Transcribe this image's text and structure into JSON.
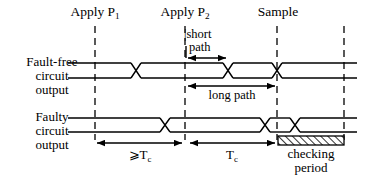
{
  "figure": {
    "width": 369,
    "height": 182,
    "background": "#ffffff",
    "line_color": "#000000"
  },
  "events": [
    {
      "id": "apply-p1",
      "label_main": "Apply",
      "label_sym": "P",
      "label_sub": "1",
      "x": 95
    },
    {
      "id": "apply-p2",
      "label_main": "Apply",
      "label_sym": "P",
      "label_sub": "2",
      "x": 185
    },
    {
      "id": "sample",
      "label_main": "Sample",
      "label_sym": "",
      "label_sub": "",
      "x": 277
    },
    {
      "id": "end",
      "label_main": "",
      "label_sym": "",
      "label_sub": "",
      "x": 344
    }
  ],
  "waveforms": [
    {
      "id": "fault-free",
      "label_lines": [
        "Fault-free",
        "circuit",
        "output"
      ],
      "y_top": 63,
      "y_bottom": 78,
      "transitions": [
        136,
        228,
        277
      ]
    },
    {
      "id": "faulty",
      "label_lines": [
        "Faulty",
        "circuit",
        "output"
      ],
      "y_top": 118,
      "y_bottom": 132,
      "transitions": [
        165,
        265,
        295
      ]
    }
  ],
  "annotations": [
    {
      "id": "short-path",
      "text_lines": [
        "|short",
        "path"
      ],
      "arrow": {
        "x1": 186,
        "x2": 228,
        "y": 58,
        "heads": "both"
      }
    },
    {
      "id": "long-path",
      "text_lines": [
        "long path"
      ],
      "arrow": {
        "x1": 186,
        "x2": 277,
        "y": 86,
        "heads": "both"
      }
    }
  ],
  "measurements": [
    {
      "id": "ge-tc",
      "label_prefix": "⩾",
      "label_sym": "T",
      "label_sub": "c",
      "arrow": {
        "x1": 95,
        "x2": 184,
        "y": 143,
        "heads": "both"
      }
    },
    {
      "id": "tc",
      "label_prefix": "",
      "label_sym": "T",
      "label_sub": "c",
      "arrow": {
        "x1": 188,
        "x2": 277,
        "y": 143,
        "heads": "both"
      }
    },
    {
      "id": "checking-period",
      "label_lines": [
        "checking",
        "period"
      ],
      "hatched_box": {
        "x1": 278,
        "x2": 344,
        "y1": 136,
        "y2": 144
      }
    }
  ],
  "row_label_anchor_x": 52
}
